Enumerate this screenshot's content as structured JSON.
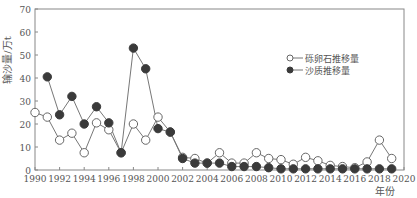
{
  "chart_data": {
    "type": "line",
    "title": "",
    "xlabel": "年份",
    "ylabel": "输沙量/万t",
    "xlim": [
      1990,
      2020
    ],
    "ylim": [
      0,
      70
    ],
    "x_ticks": [
      1990,
      1992,
      1994,
      1996,
      1998,
      2000,
      2002,
      2004,
      2006,
      2008,
      2010,
      2012,
      2014,
      2016,
      2018,
      2020
    ],
    "y_ticks": [
      0,
      10,
      20,
      30,
      40,
      50,
      60,
      70
    ],
    "grid": false,
    "legend_position": "upper right (inside)",
    "series": [
      {
        "name": "砾卵石推移量",
        "marker": "open-circle",
        "x": [
          1990,
          1991,
          1992,
          1993,
          1994,
          1995,
          1996,
          1997,
          1998,
          1999,
          2000,
          2001,
          2002,
          2003,
          2004,
          2005,
          2006,
          2007,
          2008,
          2009,
          2010,
          2011,
          2012,
          2013,
          2014,
          2015,
          2016,
          2017,
          2018,
          2019
        ],
        "values": [
          25,
          23,
          13,
          16,
          7.5,
          20.5,
          17.5,
          7.5,
          20,
          13,
          23,
          16.5,
          5.5,
          5,
          3,
          7.5,
          3,
          3,
          7.5,
          5,
          4.5,
          2.5,
          5.5,
          4,
          2,
          1.5,
          1,
          3.5,
          13,
          5
        ]
      },
      {
        "name": "沙质推移量",
        "marker": "filled-circle",
        "x": [
          1991,
          1992,
          1993,
          1994,
          1995,
          1996,
          1997,
          1998,
          1999,
          2000,
          2001,
          2002,
          2003,
          2004,
          2005,
          2006,
          2007,
          2008,
          2009,
          2010,
          2011,
          2012,
          2013,
          2014,
          2015,
          2016,
          2017,
          2018,
          2019
        ],
        "values": [
          40.5,
          24,
          32,
          20,
          27.5,
          20.5,
          7.5,
          53,
          44,
          18,
          16.5,
          5,
          3,
          3,
          3,
          1.5,
          1.5,
          1.5,
          1,
          0.5,
          0.5,
          0.5,
          0.5,
          0.5,
          0.5,
          0.5,
          0.5,
          0.5,
          0.5
        ]
      }
    ]
  },
  "colors": {
    "axis": "#888888",
    "line": "#777777",
    "filled_marker": "#3a3a3a",
    "open_marker_fill": "#ffffff"
  }
}
